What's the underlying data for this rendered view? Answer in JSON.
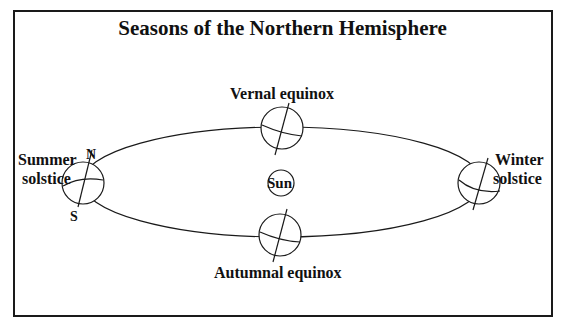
{
  "title": "Seasons of the Northern Hemisphere",
  "labels": {
    "vernal": "Vernal equinox",
    "autumnal": "Autumnal equinox",
    "summer_line1": "Summer",
    "summer_line2": "solstice",
    "winter_line1": "Winter",
    "winter_line2": "solstice",
    "sun": "Sun",
    "north": "N",
    "south": "S"
  },
  "colors": {
    "line": "#1a1a1a",
    "background": "#ffffff"
  }
}
